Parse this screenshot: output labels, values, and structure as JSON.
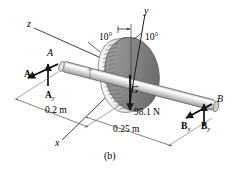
{
  "figure": {
    "caption": "(b)",
    "type": "free-body-diagram"
  },
  "axes": {
    "z_label": "z",
    "y_label": "y",
    "x_label": "x"
  },
  "points": {
    "a_label": "A",
    "b_label": "B",
    "g_label": "G"
  },
  "angles": {
    "left": "10°",
    "right": "10°"
  },
  "forces": {
    "ax": {
      "letter": "A",
      "sub": "x"
    },
    "ay": {
      "letter": "A",
      "sub": "y"
    },
    "bx": {
      "letter": "B",
      "sub": "x"
    },
    "by": {
      "letter": "B",
      "sub": "y"
    },
    "weight": "98.1 N"
  },
  "dimensions": {
    "left_span": "0.2 m",
    "right_span": "0.25 m"
  },
  "colors": {
    "line": "#1a1a1a",
    "shaft_light": "#f2f2f2",
    "shaft_mid": "#d8d8d8",
    "shaft_dark": "#a8a8a8",
    "gear_body": "#8e8e8e",
    "gear_dark": "#6f6f6f",
    "gear_teeth": "#f0f0f0",
    "dim_line": "#555555",
    "background": "#ffffff"
  }
}
